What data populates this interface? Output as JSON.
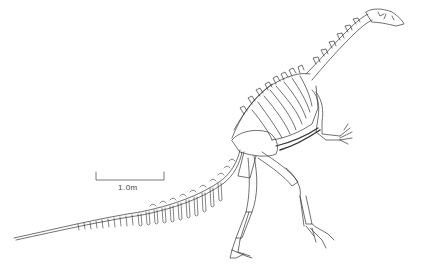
{
  "figure": {
    "scale_bar": {
      "label": "1.0m"
    },
    "colors": {
      "line": "#333333",
      "background": "#ffffff"
    }
  }
}
